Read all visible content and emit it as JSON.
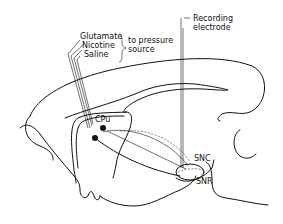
{
  "diagram": {
    "type": "sagittal brain section schematic",
    "labels": {
      "glutamate": "Glutamate",
      "nicotine": "Nicotine",
      "saline": "Saline",
      "pressure_1": "to pressure",
      "pressure_2": "source",
      "recording_1": "Recording",
      "recording_2": "electrode",
      "cpu": "CPu",
      "snc": "SNC",
      "snr": "SNR"
    },
    "colors": {
      "line": "#111111",
      "background": "#ffffff"
    }
  }
}
